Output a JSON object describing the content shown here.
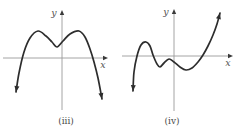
{
  "figure": {
    "background": "#ffffff",
    "curve_color": "#2d2d2d",
    "axis_color": "#9a9a9a",
    "axis_arrow_color": "#3a3a3a",
    "label_color": "#555555",
    "caption_color": "#4a4a4a"
  },
  "chart_data": [
    {
      "id": "iii",
      "type": "line",
      "title": "",
      "caption": "(iii)",
      "xlabel": "x",
      "ylabel": "y",
      "description": "Unlabeled polynomial-style curve (quartic shape, negative leading coefficient): rises from lower left, local maximum, local minimum above the x-axis, second local maximum, then falls to lower right; arrowheads on both curve ends and on axis tips; no tick marks or numeric labels shown",
      "axis": {
        "grid": false,
        "tick_labels_shown": false
      },
      "features_px": {
        "local_maxima": [
          [
            38,
            31
          ],
          [
            79,
            31
          ]
        ],
        "local_minima": [
          [
            57,
            47
          ]
        ],
        "x_intercepts": [
          22,
          93
        ],
        "end_behavior": "both ends point downward"
      },
      "pixel_geometry": {
        "x_axis": {
          "x1": 3,
          "x2": 104,
          "y": 58,
          "tip": [
            108,
            58
          ]
        },
        "y_axis": {
          "x": 62,
          "y1": 110,
          "y2": 14,
          "tip": [
            62,
            10
          ]
        },
        "curve_points": [
          [
            16,
            92
          ],
          [
            19,
            73
          ],
          [
            24,
            52
          ],
          [
            30,
            38
          ],
          [
            38,
            31
          ],
          [
            46,
            36
          ],
          [
            52,
            42
          ],
          [
            57,
            47
          ],
          [
            63,
            41
          ],
          [
            70,
            34
          ],
          [
            79,
            31
          ],
          [
            85,
            37
          ],
          [
            90,
            49
          ],
          [
            94,
            62
          ],
          [
            98,
            78
          ],
          [
            102,
            99
          ]
        ],
        "xlabel_pos": [
          103,
          68
        ],
        "ylabel_pos": [
          54,
          16
        ],
        "caption_pos": [
          66,
          124
        ]
      }
    },
    {
      "id": "iv",
      "type": "line",
      "title": "",
      "caption": "(iv)",
      "xlabel": "x",
      "ylabel": "y",
      "description": "Unlabeled polynomial-style curve (quintic shape, positive leading coefficient): rises from lower left, local maximum above the x-axis, local minimum below, small local maximum near the origin just under the x-axis, shallow local minimum, then rises steeply to upper right; arrowheads on both curve ends and on axis tips; no tick marks or numeric labels shown",
      "axis": {
        "grid": false,
        "tick_labels_shown": false
      },
      "features_px": {
        "local_maxima": [
          [
            146,
            42
          ],
          [
            169,
            59
          ]
        ],
        "local_minima": [
          [
            159,
            67
          ],
          [
            186,
            70
          ]
        ],
        "x_intercepts": [
          136,
          154,
          202
        ],
        "end_behavior": "left end points downward, right end points upward"
      },
      "pixel_geometry": {
        "x_axis": {
          "x1": 122,
          "x2": 229,
          "y": 56,
          "tip": [
            233,
            56
          ]
        },
        "y_axis": {
          "x": 174,
          "y1": 111,
          "y2": 13,
          "tip": [
            174,
            9
          ]
        },
        "curve_points": [
          [
            133,
            91
          ],
          [
            134,
            72
          ],
          [
            137,
            56
          ],
          [
            141,
            45
          ],
          [
            146,
            42
          ],
          [
            150,
            46
          ],
          [
            153,
            55
          ],
          [
            157,
            64
          ],
          [
            160,
            67
          ],
          [
            164,
            63
          ],
          [
            169,
            59
          ],
          [
            174,
            62
          ],
          [
            180,
            67
          ],
          [
            186,
            70
          ],
          [
            192,
            68
          ],
          [
            198,
            62
          ],
          [
            203,
            55
          ],
          [
            208,
            46
          ],
          [
            213,
            35
          ],
          [
            217,
            24
          ],
          [
            220,
            13
          ]
        ],
        "xlabel_pos": [
          228,
          66
        ],
        "ylabel_pos": [
          166,
          15
        ],
        "caption_pos": [
          172,
          124
        ]
      }
    }
  ]
}
